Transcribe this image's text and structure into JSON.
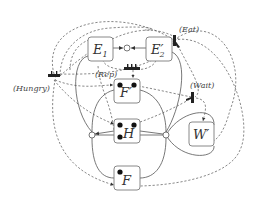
{
  "diagram": {
    "type": "petri-net",
    "places": [
      {
        "id": "E1",
        "label": "E",
        "sub": "1",
        "tokens": 0
      },
      {
        "id": "E2p",
        "label": "E′",
        "sub": "2",
        "tokens": 0
      },
      {
        "id": "Fp",
        "label": "F′",
        "sub": "",
        "tokens": 2
      },
      {
        "id": "H",
        "label": "H",
        "sub": "",
        "tokens": 3
      },
      {
        "id": "F",
        "label": "F",
        "sub": "",
        "tokens": 1
      },
      {
        "id": "Wp",
        "label": "W′",
        "sub": "",
        "tokens": 0
      }
    ],
    "transitions": [
      {
        "id": "eat",
        "label": "(Eat)"
      },
      {
        "id": "rep",
        "label": "(Rep)"
      },
      {
        "id": "wait",
        "label": "(Wait)"
      },
      {
        "id": "hungry",
        "label": "(Hungry)"
      }
    ],
    "junctions": [
      "E1-E2p",
      "left",
      "right"
    ],
    "edge_styles": {
      "solid": "#555555",
      "dashed": "#555555"
    }
  }
}
